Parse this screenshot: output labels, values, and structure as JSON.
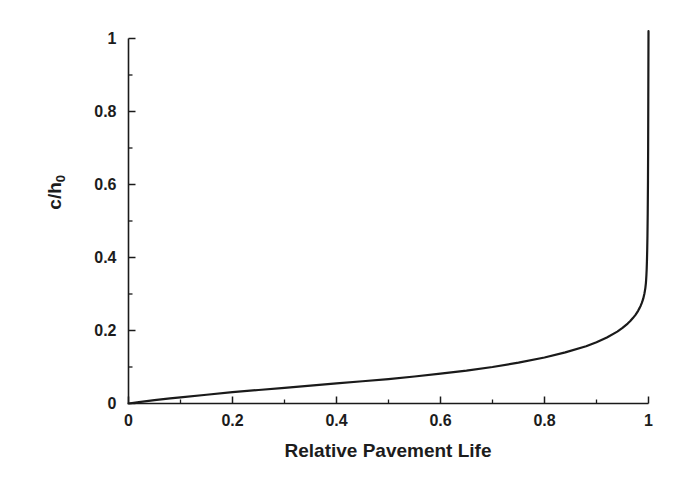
{
  "chart_data": {
    "type": "line",
    "title": "",
    "xlabel": "Relative Pavement Life",
    "ylabel": "c/h0",
    "ylabel_base": "c/h",
    "ylabel_sub": "0",
    "xlim": [
      0,
      1
    ],
    "ylim": [
      0,
      1
    ],
    "grid": false,
    "legend": null,
    "xticks": [
      "0",
      "0.2",
      "0.4",
      "0.6",
      "0.8",
      "1"
    ],
    "xtick_values": [
      0,
      0.2,
      0.4,
      0.6,
      0.8,
      1
    ],
    "yticks": [
      "0",
      "0.2",
      "0.4",
      "0.6",
      "0.8",
      "1"
    ],
    "ytick_values": [
      0,
      0.2,
      0.4,
      0.6,
      0.8,
      1
    ],
    "minor_ticks": true,
    "minor_tick_count_between": 1,
    "series": [
      {
        "name": "crack depth growth",
        "color": "#1a1a1a",
        "line_width": 2.2,
        "x": [
          0,
          0.02,
          0.05,
          0.08,
          0.1,
          0.15,
          0.2,
          0.25,
          0.3,
          0.35,
          0.4,
          0.45,
          0.5,
          0.55,
          0.6,
          0.65,
          0.7,
          0.75,
          0.8,
          0.84,
          0.88,
          0.9,
          0.92,
          0.94,
          0.95,
          0.96,
          0.965,
          0.97,
          0.975,
          0.98,
          0.983,
          0.985,
          0.987,
          0.989,
          0.99,
          0.991,
          0.992,
          0.993,
          0.994,
          0.995,
          0.9955,
          0.996,
          0.9965,
          0.997,
          0.9975,
          0.998,
          0.9985,
          0.999,
          0.9993,
          0.9996,
          1.0
        ],
        "y": [
          0,
          0.004,
          0.009,
          0.014,
          0.017,
          0.024,
          0.031,
          0.037,
          0.043,
          0.049,
          0.055,
          0.061,
          0.067,
          0.074,
          0.082,
          0.09,
          0.1,
          0.112,
          0.126,
          0.14,
          0.157,
          0.168,
          0.181,
          0.197,
          0.207,
          0.219,
          0.226,
          0.234,
          0.243,
          0.254,
          0.262,
          0.268,
          0.275,
          0.283,
          0.288,
          0.294,
          0.3,
          0.308,
          0.317,
          0.33,
          0.34,
          0.352,
          0.368,
          0.39,
          0.42,
          0.46,
          0.52,
          0.61,
          0.7,
          0.83,
          1.02
        ]
      }
    ]
  },
  "axes": {
    "spine_color": "#1a1a1a",
    "tick_color": "#1a1a1a",
    "background": "#ffffff"
  }
}
